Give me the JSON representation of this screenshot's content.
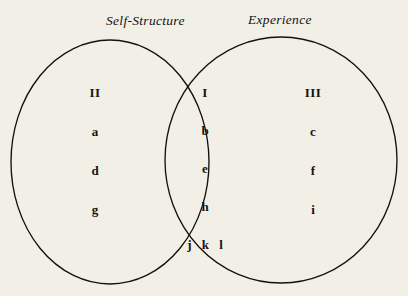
{
  "diagram": {
    "type": "venn",
    "title": "",
    "background_color": "#f2efe7",
    "stroke_color": "#14110e",
    "labels": {
      "left_set": "Self-Structure",
      "right_set": "Experience"
    },
    "regions": {
      "left_only": {
        "name": "Self-Structure only",
        "roman": "II",
        "items": [
          "II",
          "a",
          "d",
          "g"
        ]
      },
      "intersection": {
        "name": "Self-Structure and Experience",
        "roman": "I",
        "items": [
          "I",
          "b",
          "e",
          "h",
          "j k l"
        ]
      },
      "right_only": {
        "name": "Experience only",
        "roman": "III",
        "items": [
          "III",
          "c",
          "f",
          "i"
        ]
      }
    },
    "geometry": {
      "left_circle": {
        "cx": 110,
        "cy": 162,
        "rx": 99,
        "ry": 122
      },
      "right_circle": {
        "cx": 281,
        "cy": 160,
        "rx": 116,
        "ry": 123
      }
    }
  }
}
